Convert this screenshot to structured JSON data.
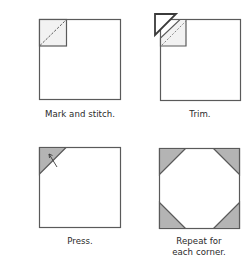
{
  "steps": [
    {
      "id": "mark",
      "caption": "Mark and stitch."
    },
    {
      "id": "trim",
      "caption": "Trim."
    },
    {
      "id": "press",
      "caption": "Press."
    },
    {
      "id": "repeat",
      "caption": "Repeat for\neach corner."
    }
  ],
  "colors": {
    "outline": "#5a5a5a",
    "light_fill": "#f2f2f2",
    "shaded_fill": "#b4b4b4",
    "text": "#2a2a2a"
  }
}
